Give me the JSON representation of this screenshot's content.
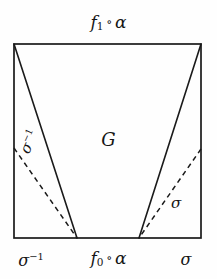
{
  "figure": {
    "title_top": "f₁ ∘ α",
    "region_label": "G",
    "bottom_left_label": "σ⁻¹",
    "bottom_center_label": "f₀ ∘ α",
    "bottom_right_label": "σ",
    "inner_left_label": "σ⁻¹",
    "inner_right_label": "σ",
    "colors": {
      "stroke": "#1a1a1a",
      "background": "#fefefe",
      "text": "#151515"
    },
    "geometry": {
      "rect": {
        "x": 14,
        "y": 44,
        "width": 187,
        "height": 194
      },
      "apex_left": {
        "x": 77,
        "y": 238
      },
      "apex_right": {
        "x": 139,
        "y": 238
      },
      "solid_left_top": {
        "x": 14,
        "y": 44
      },
      "solid_right_top": {
        "x": 201,
        "y": 44
      },
      "dashed_left_start": {
        "x": 14,
        "y": 148
      },
      "dashed_right_start": {
        "x": 201,
        "y": 149
      }
    },
    "stroke_width": 1.6,
    "dash_pattern": "5 4"
  },
  "icons": {
    "quadrilateral": "region-outline",
    "dashed_ray": "dashed-ray"
  }
}
